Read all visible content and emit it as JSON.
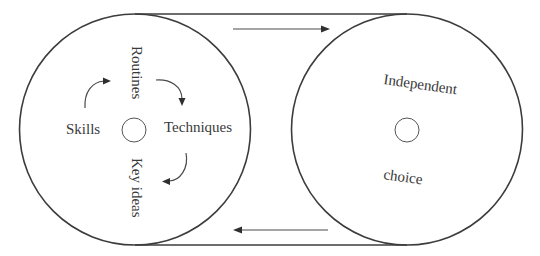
{
  "diagram": {
    "title": "",
    "colors": {
      "stroke": "#3c3c3c",
      "text": "#3a3a3a",
      "background": "#ffffff"
    },
    "left_circle": {
      "labels": {
        "top": "Routines",
        "right": "Techniques",
        "bottom": "Key ideas",
        "left": "Skills"
      },
      "cycle_arrows": [
        {
          "from": "Skills",
          "to": "Routines"
        },
        {
          "from": "Routines",
          "to": "Techniques"
        },
        {
          "from": "Techniques",
          "to": "Key ideas"
        }
      ]
    },
    "right_circle": {
      "labels": {
        "top": "Independent",
        "bottom": "choice"
      }
    },
    "connectors": [
      {
        "name": "top-arrow",
        "direction": "right",
        "from": "left_circle",
        "to": "right_circle"
      },
      {
        "name": "bottom-arrow",
        "direction": "left",
        "from": "right_circle",
        "to": "left_circle"
      }
    ]
  }
}
